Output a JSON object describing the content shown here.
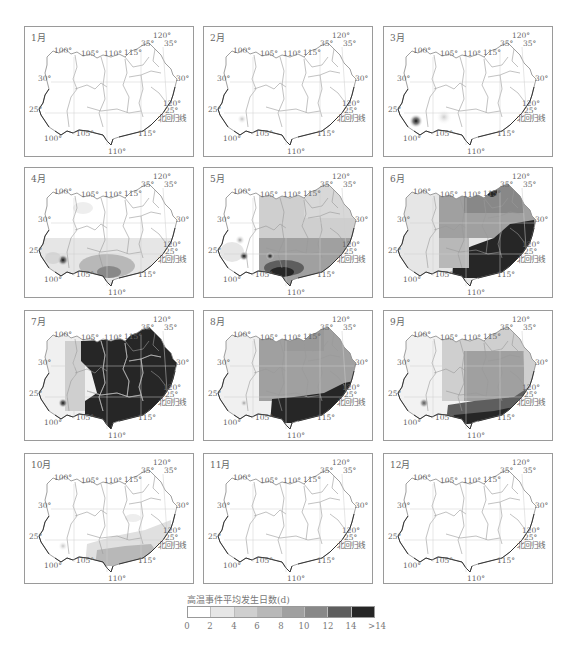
{
  "chart_data": {
    "type": "heatmap",
    "subtitle": "",
    "layout": {
      "rows": 4,
      "cols": 3,
      "grid": "graticule lines (100°–120°E, 25°–35°N)",
      "legend_position": "bottom-center"
    },
    "panels": [
      {
        "month": "1月",
        "description": "Nearly all 0–2 d; no high-temperature events",
        "max_class": "0-2"
      },
      {
        "month": "2月",
        "description": "Nearly all 0–2 d; faint spot in SW Yunnan",
        "max_class": "2-4"
      },
      {
        "month": "3月",
        "description": "Mostly 0–2 d; isolated hotspot in SW Yunnan (>14 d locally), light patch in Guangxi",
        "max_class": ">14"
      },
      {
        "month": "4月",
        "description": "2–8 d across southern Guangxi/Guangdong; hotspot in SW Yunnan; light patches in Sichuan basin",
        "max_class": "12-14"
      },
      {
        "month": "5月",
        "description": "4–10 d widespread over south and east; 12–>14 d along Guangxi/Leizhou coast; spots in Yunnan",
        "max_class": ">14"
      },
      {
        "month": "6月",
        "description": ">14 d over Guangdong, Guangxi, Fujian, Jiangxi south; 8–12 d central/Yangtze; 2–6 d Yunnan",
        "max_class": ">14"
      },
      {
        "month": "7月",
        "description": ">14 d across nearly entire central, eastern and southern region; Yunnan/W Sichuan 0–6 d",
        "max_class": ">14"
      },
      {
        "month": "8月",
        "description": ">14 d over Guangdong/Guangxi coast; 8–12 d across central and eastern; Yunnan 0–4 d",
        "max_class": ">14"
      },
      {
        "month": "9月",
        "description": "12–>14 d along southern coast; 4–10 d central/eastern; Yunnan low with small spot",
        "max_class": ">14"
      },
      {
        "month": "10月",
        "description": "2–6 d in Guangdong/Guangxi/south Fujian; rest 0–2 d",
        "max_class": "6-8"
      },
      {
        "month": "11月",
        "description": "All 0–2 d",
        "max_class": "0-2"
      },
      {
        "month": "12月",
        "description": "All 0–2 d",
        "max_class": "0-2"
      }
    ],
    "legend": {
      "title": "高温事件平均发生日数(d)",
      "tick_labels": [
        "0",
        "2",
        "4",
        "6",
        "8",
        "10",
        "12",
        "14",
        ">14"
      ],
      "bins": [
        "0-2",
        "2-4",
        "4-6",
        "6-8",
        "8-10",
        "10-12",
        "12-14",
        ">14"
      ],
      "colors": [
        "#ffffff",
        "#e6e6e6",
        "#cfcfcf",
        "#b8b8b8",
        "#a0a0a0",
        "#888888",
        "#5e5e5e",
        "#262626"
      ]
    },
    "map_labels": {
      "lon": [
        "100°",
        "105°",
        "110°",
        "115°",
        "120°"
      ],
      "lat": [
        "25°",
        "30°",
        "35°"
      ],
      "tropic": "北回归线"
    }
  },
  "months": [
    "1月",
    "2月",
    "3月",
    "4月",
    "5月",
    "6月",
    "7月",
    "8月",
    "9月",
    "10月",
    "11月",
    "12月"
  ],
  "labels": {
    "lon100": "100°",
    "lon105": "105°",
    "lon110": "110°",
    "lon115": "115°",
    "lon120": "120°",
    "lat30": "30°",
    "lat25": "25°",
    "lat35": "35°",
    "tropic": "北回归线"
  },
  "legend": {
    "title": "高温事件平均发生日数(d)",
    "ticks": [
      "0",
      "2",
      "4",
      "6",
      "8",
      "10",
      "12",
      "14",
      ">14"
    ]
  }
}
